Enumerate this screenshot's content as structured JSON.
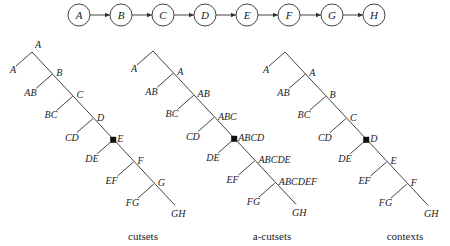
{
  "chain": {
    "nodes": [
      "A",
      "B",
      "C",
      "D",
      "E",
      "F",
      "G",
      "H"
    ],
    "x": [
      79,
      121,
      163,
      205,
      247,
      289,
      332,
      374
    ],
    "y": 15,
    "r": 11
  },
  "trees": [
    {
      "caption": "cutsets",
      "caption_x": 143,
      "apex": [
        32,
        52
      ],
      "leaf_left": {
        "label": "A"
      },
      "apex_label": "A",
      "nodes": [
        {
          "label": "B",
          "leaf": "AB"
        },
        {
          "label": "C",
          "leaf": "BC"
        },
        {
          "label": "D",
          "leaf": "CD"
        },
        {
          "label": "E",
          "leaf": "DE",
          "marked": true
        },
        {
          "label": "F",
          "leaf": "EF"
        },
        {
          "label": "G",
          "leaf": "FG"
        }
      ],
      "end_label": "GH"
    },
    {
      "caption": "a-cutsets",
      "caption_x": 272,
      "apex": [
        153,
        51
      ],
      "leaf_left": {
        "label": "A"
      },
      "apex_label": "",
      "nodes": [
        {
          "label": "A",
          "leaf": "AB"
        },
        {
          "label": "AB",
          "leaf": "BC"
        },
        {
          "label": "ABC",
          "leaf": "CD"
        },
        {
          "label": "ABCD",
          "leaf": "DE",
          "marked": true
        },
        {
          "label": "ABCDE",
          "leaf": "EF"
        },
        {
          "label": "ABCDEF",
          "leaf": "FG"
        }
      ],
      "end_label": "GH"
    },
    {
      "caption": "contexts",
      "caption_x": 405,
      "apex": [
        285,
        52
      ],
      "leaf_left": {
        "label": "A"
      },
      "apex_label": "",
      "nodes": [
        {
          "label": "A",
          "leaf": "AB"
        },
        {
          "label": "B",
          "leaf": "BC"
        },
        {
          "label": "C",
          "leaf": "CD"
        },
        {
          "label": "D",
          "leaf": "DE",
          "marked": true
        },
        {
          "label": "E",
          "leaf": "EF"
        },
        {
          "label": "F",
          "leaf": "FG"
        }
      ],
      "end_label": "GH"
    }
  ],
  "colors": {
    "line": "#444444",
    "text": "#222222",
    "marker": "#111111"
  }
}
